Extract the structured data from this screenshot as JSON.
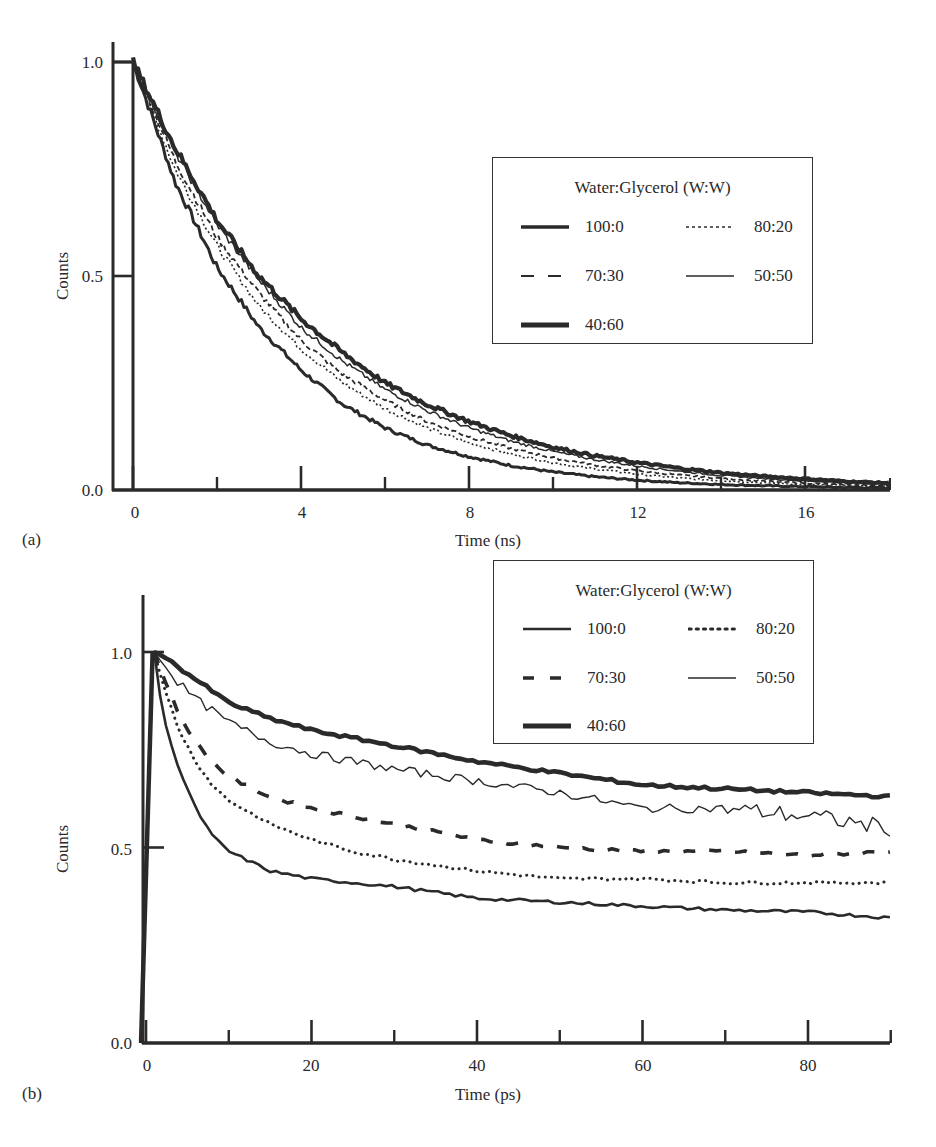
{
  "chart_data": [
    {
      "panel": "(a)",
      "type": "line",
      "title": "",
      "xlabel": "Time (ns)",
      "ylabel": "Counts",
      "xlim": [
        -0.5,
        18
      ],
      "ylim": [
        0.0,
        1.05
      ],
      "xticks_major": [
        0,
        4,
        8,
        12,
        16
      ],
      "xticks_minor": [
        2,
        6,
        10,
        14
      ],
      "yticks": [
        0.0,
        0.5,
        1.0
      ],
      "ytick_labels": [
        "0.0",
        "0.5",
        "1.0"
      ],
      "grid": false,
      "legend_position": "upper right",
      "legend_title": "Water:Glycerol (W:W)",
      "x": [
        0,
        1,
        2,
        3,
        4,
        5,
        6,
        7,
        8,
        9,
        10,
        11,
        12,
        13,
        14,
        15,
        16,
        17,
        18
      ],
      "series": [
        {
          "name": "100:0",
          "style": "solid-medium",
          "values": [
            1.0,
            0.72,
            0.52,
            0.38,
            0.28,
            0.2,
            0.145,
            0.105,
            0.078,
            0.057,
            0.042,
            0.031,
            0.023,
            0.017,
            0.013,
            0.01,
            0.008,
            0.006,
            0.005
          ]
        },
        {
          "name": "80:20",
          "style": "dotted",
          "values": [
            1.0,
            0.75,
            0.57,
            0.43,
            0.33,
            0.25,
            0.19,
            0.145,
            0.11,
            0.084,
            0.064,
            0.049,
            0.037,
            0.028,
            0.022,
            0.017,
            0.013,
            0.01,
            0.008
          ]
        },
        {
          "name": "70:30",
          "style": "dashed",
          "values": [
            1.0,
            0.77,
            0.59,
            0.46,
            0.35,
            0.27,
            0.21,
            0.16,
            0.125,
            0.097,
            0.075,
            0.058,
            0.045,
            0.035,
            0.027,
            0.021,
            0.016,
            0.012,
            0.01
          ]
        },
        {
          "name": "50:50",
          "style": "solid-thin",
          "values": [
            1.0,
            0.79,
            0.62,
            0.49,
            0.38,
            0.3,
            0.235,
            0.185,
            0.145,
            0.114,
            0.09,
            0.071,
            0.056,
            0.044,
            0.034,
            0.027,
            0.021,
            0.017,
            0.013
          ]
        },
        {
          "name": "40:60",
          "style": "solid-thick",
          "values": [
            1.0,
            0.8,
            0.63,
            0.5,
            0.4,
            0.32,
            0.25,
            0.2,
            0.16,
            0.127,
            0.1,
            0.08,
            0.064,
            0.051,
            0.04,
            0.032,
            0.026,
            0.02,
            0.016
          ]
        }
      ],
      "instrument_response": {
        "description": "rectangular response at x≈0",
        "height": 1.0
      }
    },
    {
      "panel": "(b)",
      "type": "line",
      "title": "",
      "xlabel": "Time (ps)",
      "ylabel": "Counts",
      "xlim": [
        -4,
        90
      ],
      "ylim": [
        0.0,
        1.15
      ],
      "xticks_major": [
        0,
        20,
        40,
        60,
        80
      ],
      "xticks_minor": [
        10,
        30,
        50,
        70,
        90
      ],
      "yticks": [
        0.0,
        0.5,
        1.0
      ],
      "ytick_labels": [
        "0.0",
        "0.5",
        "1.0"
      ],
      "grid": false,
      "legend_position": "upper right",
      "legend_title": "Water:Glycerol (W:W)",
      "x": [
        0,
        1,
        2,
        4,
        6,
        8,
        10,
        15,
        20,
        25,
        30,
        40,
        50,
        60,
        70,
        80,
        90
      ],
      "series": [
        {
          "name": "100:0",
          "style": "solid-medium",
          "values": [
            0.0,
            1.0,
            0.84,
            0.7,
            0.6,
            0.53,
            0.49,
            0.44,
            0.42,
            0.41,
            0.4,
            0.37,
            0.36,
            0.35,
            0.34,
            0.335,
            0.32
          ]
        },
        {
          "name": "80:20",
          "style": "dotted",
          "values": [
            0.0,
            1.0,
            0.92,
            0.8,
            0.72,
            0.66,
            0.62,
            0.56,
            0.52,
            0.49,
            0.47,
            0.44,
            0.42,
            0.42,
            0.41,
            0.41,
            0.41
          ]
        },
        {
          "name": "70:30",
          "style": "dashed",
          "values": [
            0.0,
            1.0,
            0.94,
            0.84,
            0.77,
            0.72,
            0.68,
            0.63,
            0.6,
            0.58,
            0.56,
            0.52,
            0.5,
            0.49,
            0.49,
            0.48,
            0.49
          ]
        },
        {
          "name": "50:50",
          "style": "solid-thin",
          "values": [
            0.0,
            1.0,
            0.97,
            0.92,
            0.88,
            0.85,
            0.82,
            0.77,
            0.74,
            0.72,
            0.7,
            0.67,
            0.64,
            0.6,
            0.6,
            0.58,
            0.55
          ]
        },
        {
          "name": "40:60",
          "style": "solid-thick",
          "values": [
            0.0,
            1.0,
            0.99,
            0.96,
            0.93,
            0.9,
            0.87,
            0.83,
            0.8,
            0.78,
            0.76,
            0.72,
            0.69,
            0.66,
            0.65,
            0.64,
            0.63
          ]
        }
      ]
    }
  ],
  "panels": {
    "a": {
      "label": "(a)",
      "xlabel": "Time (ns)",
      "ylabel": "Counts",
      "xtick_labels": [
        "0",
        "4",
        "8",
        "12",
        "16"
      ],
      "ytick_labels": [
        "0.0",
        "0.5",
        "1.0"
      ],
      "legend": {
        "title": "Water:Glycerol (W:W)",
        "items": [
          "100:0",
          "80:20",
          "70:30",
          "50:50",
          "40:60"
        ]
      }
    },
    "b": {
      "label": "(b)",
      "xlabel": "Time (ps)",
      "ylabel": "Counts",
      "xtick_labels": [
        "0",
        "20",
        "40",
        "60",
        "80"
      ],
      "ytick_labels": [
        "0.0",
        "0.5",
        "1.0"
      ],
      "legend": {
        "title": "Water:Glycerol (W:W)",
        "items": [
          "100:0",
          "80:20",
          "70:30",
          "50:50",
          "40:60"
        ]
      }
    }
  },
  "colors": {
    "ink": "#2a2a2a",
    "background": "#ffffff"
  }
}
